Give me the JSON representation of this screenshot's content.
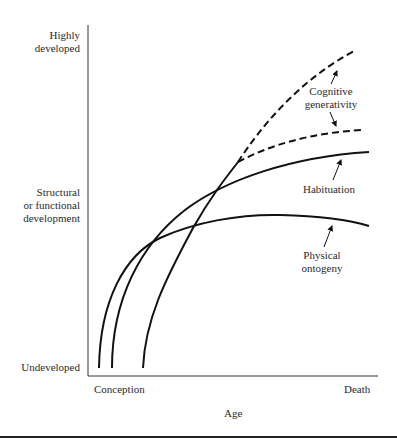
{
  "figure": {
    "y_axis": {
      "top_label": [
        "Highly",
        "developed"
      ],
      "middle_label": [
        "Structural",
        "or functional",
        "development"
      ],
      "bottom_label": "Undeveloped"
    },
    "x_axis": {
      "start_label": "Conception",
      "end_label": "Death",
      "title": "Age"
    },
    "curves": [
      {
        "name": "Physical ontogeny",
        "label_lines": [
          "Physical",
          "ontogeny"
        ],
        "style": "solid"
      },
      {
        "name": "Habituation",
        "label_lines": [
          "Habituation"
        ],
        "style": "solid"
      },
      {
        "name": "Cognitive generativity",
        "label_lines": [
          "Cognitive",
          "generativity"
        ],
        "style": "solid then dashed (two branches)"
      }
    ],
    "colors": {
      "line": "#111111",
      "text": "#2a2a2a",
      "background": "#ffffff"
    }
  }
}
